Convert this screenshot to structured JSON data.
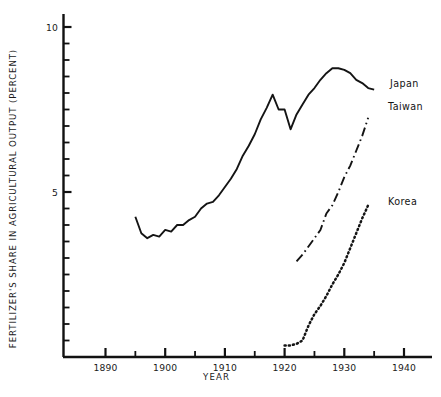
{
  "chart_data": {
    "type": "line",
    "title": "",
    "xlabel": "YEAR",
    "ylabel": "FERTILIZER'S SHARE IN AGRICULTURAL OUTPUT  (PERCENT)",
    "xlim": [
      1884,
      1943
    ],
    "ylim": [
      0,
      10.6
    ],
    "grid": false,
    "legend_position": "inline-right-of-line-ends",
    "x_major_ticks": [
      1890,
      1900,
      1910,
      1920,
      1930,
      1940
    ],
    "x_major_tick_labels": [
      "1890",
      "1900",
      "1910",
      "1920",
      "1930",
      "1940"
    ],
    "x_minor_ticks": [
      1895,
      1905,
      1915,
      1925,
      1935
    ],
    "y_major_ticks": [
      5,
      10
    ],
    "y_major_tick_labels": [
      "5",
      "10"
    ],
    "y_minor_ticks": [
      0.5,
      1,
      1.5,
      2,
      2.5,
      3,
      3.5,
      4,
      4.5,
      5.5,
      6,
      6.5,
      7,
      7.5,
      8,
      8.5,
      9,
      9.5
    ],
    "series": [
      {
        "name": "Japan",
        "style": "solid",
        "label": "Japan",
        "x": [
          1895,
          1896,
          1897,
          1898,
          1899,
          1900,
          1901,
          1902,
          1903,
          1904,
          1905,
          1906,
          1907,
          1908,
          1909,
          1910,
          1911,
          1912,
          1913,
          1914,
          1915,
          1916,
          1917,
          1918,
          1919,
          1920,
          1921,
          1922,
          1923,
          1924,
          1925,
          1926,
          1927,
          1928,
          1929,
          1930,
          1931,
          1932,
          1933,
          1934,
          1935
        ],
        "values": [
          4.25,
          3.75,
          3.6,
          3.7,
          3.65,
          3.85,
          3.8,
          4.0,
          4.0,
          4.15,
          4.25,
          4.5,
          4.65,
          4.7,
          4.9,
          5.15,
          5.4,
          5.7,
          6.1,
          6.4,
          6.75,
          7.2,
          7.55,
          7.95,
          7.5,
          7.5,
          6.9,
          7.35,
          7.65,
          7.95,
          8.15,
          8.4,
          8.6,
          8.75,
          8.75,
          8.7,
          8.6,
          8.4,
          8.3,
          8.15,
          8.1
        ]
      },
      {
        "name": "Taiwan",
        "style": "dash-dot",
        "label": "Taiwan",
        "x": [
          1922,
          1923,
          1924,
          1925,
          1926,
          1927,
          1928,
          1929,
          1930,
          1931,
          1932,
          1933,
          1934
        ],
        "values": [
          2.9,
          3.1,
          3.35,
          3.6,
          3.85,
          4.35,
          4.6,
          5.0,
          5.45,
          5.8,
          6.25,
          6.7,
          7.25
        ]
      },
      {
        "name": "Korea",
        "style": "dotted",
        "label": "Korea",
        "x": [
          1920,
          1921,
          1922,
          1923,
          1924,
          1925,
          1926,
          1927,
          1928,
          1929,
          1930,
          1931,
          1932,
          1933,
          1934
        ],
        "values": [
          0.35,
          0.35,
          0.4,
          0.5,
          0.95,
          1.3,
          1.55,
          1.85,
          2.2,
          2.5,
          2.85,
          3.3,
          3.75,
          4.2,
          4.6
        ]
      }
    ],
    "series_label_positions": [
      {
        "name": "Japan",
        "x_px": 390,
        "y_px": 78
      },
      {
        "name": "Taiwan",
        "x_px": 388,
        "y_px": 101
      },
      {
        "name": "Korea",
        "x_px": 388,
        "y_px": 196
      }
    ],
    "colors": {
      "axis": "#111111",
      "line": "#141414",
      "background": "#ffffff"
    }
  }
}
